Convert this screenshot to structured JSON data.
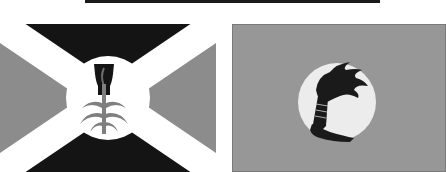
{
  "colors": {
    "background": "#ffffff",
    "topbar": "#1a1a1a",
    "black": "#141414",
    "grey": "#8c8c8c",
    "right_field": "#979797",
    "white": "#ffffff",
    "disc_right": "#ececec",
    "border": "#7a7a7a"
  },
  "flags": [
    {
      "id": "left",
      "description": "Saltire flag with central disc emblem",
      "emblem": "cup-and-plant-icon"
    },
    {
      "id": "right",
      "description": "Plain field flag with central disc emblem",
      "emblem": "torch-in-hand-icon"
    }
  ]
}
